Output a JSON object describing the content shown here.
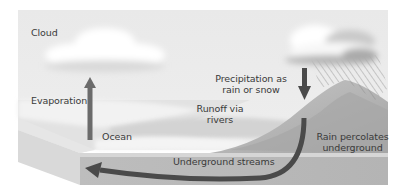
{
  "diagram": {
    "labels": {
      "cloud": "Cloud",
      "evaporation": "Evaporation",
      "ocean": "Ocean",
      "runoff_line1": "Runoff via",
      "runoff_line2": "rivers",
      "precip_line1": "Precipitation as",
      "precip_line2": "rain or snow",
      "percolate_line1": "Rain percolates",
      "percolate_line2": "underground",
      "underground": "Underground streams"
    },
    "colors": {
      "sky": "#ebebeb",
      "arrow": "#4a4a4a",
      "evaporation_arrow": "#6a6a6a",
      "land": "#a8a8a8",
      "front_face": "#b9b9b9",
      "side_face": "#dcdcdc",
      "ocean": "#e4e4e4"
    }
  }
}
